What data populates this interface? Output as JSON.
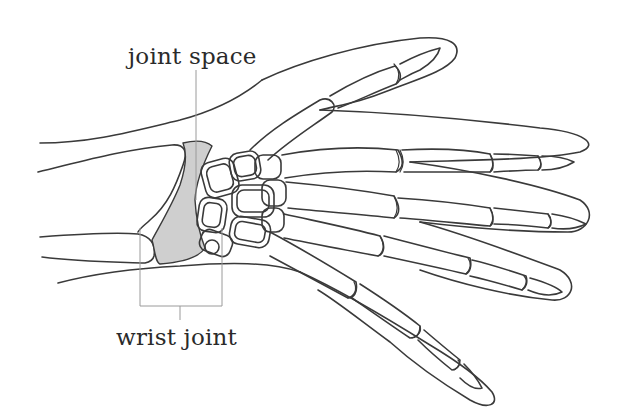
{
  "diagram": {
    "labels": {
      "joint_space": "joint space",
      "wrist_joint": "wrist joint"
    },
    "colors": {
      "outline": "#3a3a3a",
      "leader_line": "#9a9a9a",
      "joint_space_fill": "#cfcfcf",
      "background": "#ffffff",
      "text": "#2a2a2a"
    },
    "annotations": [
      {
        "label": "joint space",
        "points_to": "gray shaded gap between forearm bones and carpals"
      },
      {
        "label": "wrist joint",
        "points_to": "bracket spanning radius/ulna ends to carpal row"
      }
    ]
  }
}
